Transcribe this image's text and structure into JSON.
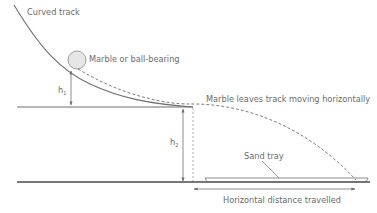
{
  "labels": {
    "curved_track": "Curved track",
    "marble": "Marble or ball-bearing",
    "leaves_track": "Marble leaves track moving horizontally",
    "h1_main": "h",
    "h1_sub": "1",
    "h2_main": "h",
    "h2_sub": "2",
    "sand_tray": "Sand tray",
    "horizontal_distance": "Horizontal distance travelled"
  },
  "colors": {
    "line": "#6f6f6f",
    "text": "#6b6b6b",
    "ground": "#4a4a4a",
    "marble_fill": "#e6e6e6",
    "marble_stroke": "#8a8a8a"
  }
}
